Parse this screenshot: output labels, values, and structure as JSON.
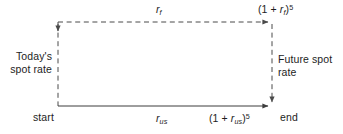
{
  "diagram": {
    "width": 343,
    "height": 134,
    "background_color": "#ffffff",
    "line_color": "#4a4a4a",
    "text_color": "#1d1d1d"
  },
  "labels": {
    "top_rate": "r",
    "top_rate_subscript": "f",
    "bottom_rate": "r",
    "bottom_rate_subscript": "us",
    "forward_expression": {
      "prefix": "(1 + ",
      "base": "r",
      "subscript": "f",
      "suffix": ")",
      "exponent": "5"
    },
    "domestic_expression": {
      "prefix": "(1 + ",
      "base": "r",
      "subscript": "us",
      "suffix": ")",
      "exponent": "5"
    },
    "start": "start",
    "end": "end",
    "todays_spot_rate": "Today's spot rate",
    "future_spot_rate": "Future spot rate"
  },
  "edges": [
    {
      "name": "left-vertical-dashed",
      "style": "dashed",
      "direction": "down",
      "from": [
        58,
        22
      ],
      "to": [
        58,
        106
      ],
      "meaning": "Today's spot rate"
    },
    {
      "name": "top-horizontal-dashed",
      "style": "dashed",
      "direction": "right",
      "from": [
        58,
        22
      ],
      "to": [
        272,
        22
      ],
      "meaning": "foreign interest rate compounding"
    },
    {
      "name": "right-vertical-dashed",
      "style": "dashed",
      "direction": "down",
      "from": [
        272,
        22
      ],
      "to": [
        272,
        106
      ],
      "meaning": "Future spot rate"
    },
    {
      "name": "bottom-horizontal-solid",
      "style": "solid",
      "direction": "right",
      "from": [
        58,
        106
      ],
      "to": [
        272,
        106
      ],
      "meaning": "US interest rate compounding"
    }
  ]
}
